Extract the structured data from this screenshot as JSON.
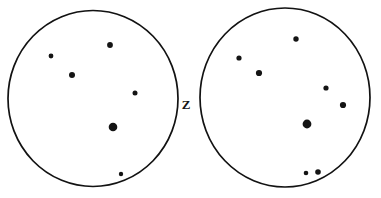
{
  "figure": {
    "background_color": "#ffffff",
    "ink_color": "#141414",
    "width": 381,
    "height": 198
  },
  "axis_label": {
    "text": "Z",
    "name": "z-axis-label",
    "x": 186,
    "y": 106
  },
  "chart_data": {
    "type": "scatter",
    "subtitle": "",
    "xlabel": "",
    "ylabel": "",
    "grid": false,
    "legend": "none",
    "annotations": [
      {
        "text": "Z",
        "x": 186,
        "y": 106
      }
    ],
    "panels": [
      {
        "name": "left-field",
        "label": "Left field of view",
        "outline": {
          "cx": 93,
          "cy": 98.5,
          "rx": 85,
          "ry": 88
        },
        "points": [
          {
            "x": 51,
            "y": 56,
            "r": 2.4,
            "magnitude": "faint"
          },
          {
            "x": 72,
            "y": 75,
            "r": 3.0,
            "magnitude": "medium"
          },
          {
            "x": 110,
            "y": 45,
            "r": 2.9,
            "magnitude": "medium"
          },
          {
            "x": 135,
            "y": 93,
            "r": 2.5,
            "magnitude": "faint"
          },
          {
            "x": 113,
            "y": 127,
            "r": 4.3,
            "magnitude": "bright"
          },
          {
            "x": 121,
            "y": 174,
            "r": 2.2,
            "magnitude": "faint"
          }
        ]
      },
      {
        "name": "right-field",
        "label": "Right field of view",
        "outline": {
          "cx": 285,
          "cy": 97.5,
          "rx": 85,
          "ry": 89.5
        },
        "points": [
          {
            "x": 296,
            "y": 39,
            "r": 2.7,
            "magnitude": "medium"
          },
          {
            "x": 239,
            "y": 58,
            "r": 2.6,
            "magnitude": "faint"
          },
          {
            "x": 259,
            "y": 73,
            "r": 3.1,
            "magnitude": "medium"
          },
          {
            "x": 326,
            "y": 88,
            "r": 2.6,
            "magnitude": "faint"
          },
          {
            "x": 343,
            "y": 105,
            "r": 3.1,
            "magnitude": "medium"
          },
          {
            "x": 307,
            "y": 124,
            "r": 4.4,
            "magnitude": "bright"
          },
          {
            "x": 306,
            "y": 173,
            "r": 2.3,
            "magnitude": "faint"
          },
          {
            "x": 318,
            "y": 172,
            "r": 2.8,
            "magnitude": "faint"
          }
        ]
      }
    ]
  }
}
